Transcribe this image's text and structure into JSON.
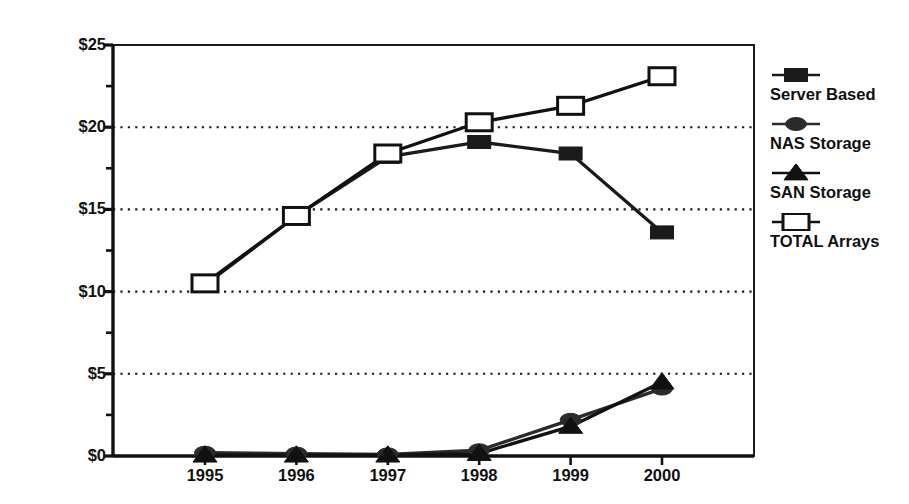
{
  "chart_data": {
    "type": "line",
    "title": "",
    "xlabel": "",
    "ylabel": "Revenue in $Billiions",
    "categories": [
      "1995",
      "1996",
      "1997",
      "1998",
      "1999",
      "2000"
    ],
    "x": [
      1995,
      1996,
      1997,
      1998,
      1999,
      2000
    ],
    "ylim": [
      0,
      25
    ],
    "xlim": [
      1994.5,
      2000.5
    ],
    "y_ticks": [
      0,
      5,
      10,
      15,
      20,
      25
    ],
    "y_tick_labels": [
      "$0",
      "$5",
      "$10",
      "$15",
      "$20",
      "$25"
    ],
    "y_minor_ticks": [
      2.5,
      7.5,
      12.5,
      17.5,
      22.5
    ],
    "grid": "horizontal-dotted-major",
    "legend_position": "right",
    "series": [
      {
        "name": "Server Based",
        "marker": "filled-square",
        "color": "#1a1a1a",
        "values": [
          10.4,
          14.6,
          18.2,
          19.1,
          18.4,
          13.6
        ]
      },
      {
        "name": "NAS Storage",
        "marker": "filled-ellipse",
        "color": "#2b2b2b",
        "values": [
          0.2,
          0.15,
          0.1,
          0.35,
          2.2,
          4.1
        ]
      },
      {
        "name": "SAN Storage",
        "marker": "filled-triangle",
        "color": "#111111",
        "values": [
          0.05,
          0.05,
          0.05,
          0.15,
          1.8,
          4.5
        ]
      },
      {
        "name": "TOTAL Arrays",
        "marker": "open-square",
        "color": "#111111",
        "values": [
          10.5,
          14.6,
          18.4,
          20.3,
          21.3,
          23.1
        ]
      }
    ]
  },
  "legend": {
    "items": [
      {
        "label": "Server Based",
        "icon": "filled-square-marker-icon"
      },
      {
        "label": "NAS Storage",
        "icon": "filled-ellipse-marker-icon"
      },
      {
        "label": "SAN Storage",
        "icon": "filled-triangle-marker-icon"
      },
      {
        "label": "TOTAL Arrays",
        "icon": "open-square-marker-icon"
      }
    ]
  }
}
